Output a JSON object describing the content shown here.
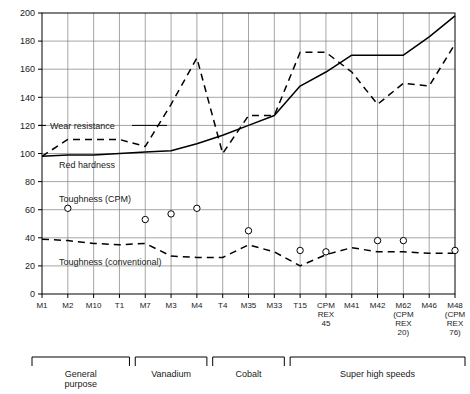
{
  "chart_data": {
    "type": "line",
    "title": "",
    "xlabel": "",
    "ylabel": "",
    "ylim": [
      0,
      200
    ],
    "ytick_step": 20,
    "yticks": [
      0,
      20,
      40,
      60,
      80,
      100,
      120,
      140,
      160,
      180,
      200
    ],
    "grid": true,
    "legend_position": "inline-annotations",
    "categories": [
      "M1",
      "M2",
      "M10",
      "T1",
      "M7",
      "M3",
      "M4",
      "T4",
      "M35",
      "M33",
      "T15",
      "CPM REX 45",
      "M41",
      "M42",
      "M62 (CPM REX 20)",
      "M46",
      "M48 (CPM REX 76)"
    ],
    "tick_labels": [
      [
        "M1"
      ],
      [
        "M2"
      ],
      [
        "M10"
      ],
      [
        "T1"
      ],
      [
        "M7"
      ],
      [
        "M3"
      ],
      [
        "M4"
      ],
      [
        "T4"
      ],
      [
        "M35"
      ],
      [
        "M33"
      ],
      [
        "T15"
      ],
      [
        "CPM",
        "REX",
        "45"
      ],
      [
        "M41"
      ],
      [
        "M42"
      ],
      [
        "M62",
        "(CPM",
        "REX",
        "20)"
      ],
      [
        "M46"
      ],
      [
        "M48",
        "(CPM",
        "REX",
        "76)"
      ]
    ],
    "series": [
      {
        "name": "Wear resistance",
        "style": "dashed",
        "marker": "none",
        "values": [
          98,
          110,
          110,
          110,
          105,
          135,
          168,
          100,
          127,
          127,
          172,
          172,
          158,
          135,
          150,
          148,
          178
        ]
      },
      {
        "name": "Red hardness",
        "style": "solid",
        "marker": "none",
        "values": [
          98,
          99,
          99,
          100,
          101,
          102,
          107,
          113,
          120,
          127,
          148,
          158,
          170,
          170,
          170,
          183,
          198
        ]
      },
      {
        "name": "Toughness (conventional)",
        "style": "dashed",
        "marker": "none",
        "values": [
          39,
          38,
          36,
          35,
          36,
          27,
          26,
          26,
          35,
          30,
          20,
          28,
          33,
          30,
          30,
          29,
          29
        ]
      },
      {
        "name": "Toughness (CPM)",
        "style": "none",
        "marker": "open-circle",
        "values": [
          null,
          61,
          null,
          null,
          53,
          57,
          61,
          null,
          45,
          null,
          31,
          30,
          null,
          38,
          38,
          null,
          31
        ]
      }
    ],
    "annotations": [
      {
        "text": "Wear resistance",
        "value": 120,
        "leader": true
      },
      {
        "text": "Red hardness",
        "value": 92,
        "leader": false
      },
      {
        "text": "Toughness (CPM)",
        "value": 68,
        "leader": false
      },
      {
        "text": "Toughness (conventional)",
        "value": 29,
        "leader": false
      }
    ],
    "groups": [
      {
        "label": "General purpose",
        "start": 0,
        "end": 3
      },
      {
        "label": "Vanadium",
        "start": 4,
        "end": 6
      },
      {
        "label": "Cobalt",
        "start": 7,
        "end": 9
      },
      {
        "label": "Super high speeds",
        "start": 10,
        "end": 16
      }
    ],
    "colors": {
      "line": "#000000",
      "grid": "#808080",
      "axis": "#000000",
      "text": "#1a1a1a",
      "background": "#ffffff"
    }
  }
}
